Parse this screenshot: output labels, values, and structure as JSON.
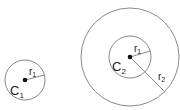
{
  "diagram": {
    "colors": {
      "stroke": "#8a8a8a",
      "dot": "#111111",
      "text": "#222222",
      "background": "#ffffff"
    },
    "circle1": {
      "center_label": "C",
      "center_sub": "1",
      "radius_label": "r",
      "radius_sub": "1"
    },
    "circle2": {
      "center_label": "C",
      "center_sub": "2",
      "inner_radius_label": "r",
      "inner_radius_sub": "1",
      "outer_radius_label": "r",
      "outer_radius_sub": "2"
    }
  }
}
